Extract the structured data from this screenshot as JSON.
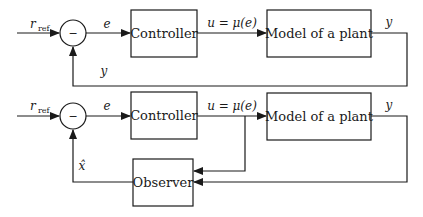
{
  "diagram": {
    "top_loop": {
      "input_label": "r",
      "input_subscript": "ref",
      "summing_junction_symbol": "−",
      "error_label": "e",
      "controller_label": "Controller",
      "control_signal_label": "u = μ(e)",
      "plant_label": "Model of a plant",
      "output_label": "y",
      "feedback_label": "y"
    },
    "bottom_loop": {
      "input_label": "r",
      "input_subscript": "ref",
      "summing_junction_symbol": "−",
      "error_label": "e",
      "controller_label": "Controller",
      "control_signal_label": "u = μ(e)",
      "plant_label": "Model of a plant",
      "output_label": "y",
      "observer_label": "Observer",
      "estimate_label": "x̂"
    }
  }
}
